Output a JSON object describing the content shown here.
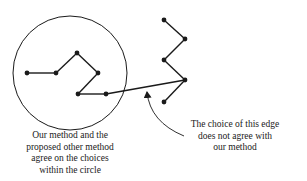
{
  "diagram": {
    "type": "tree-edge-comparison",
    "colors": {
      "stroke": "#1a1a1a",
      "background": "#ffffff"
    },
    "circle": {
      "cx": 70,
      "cy": 73,
      "r": 57
    },
    "nodes": [
      {
        "id": "a",
        "x": 27,
        "y": 73
      },
      {
        "id": "b",
        "x": 56,
        "y": 73
      },
      {
        "id": "c",
        "x": 77,
        "y": 53
      },
      {
        "id": "d",
        "x": 98,
        "y": 73
      },
      {
        "id": "e",
        "x": 78,
        "y": 94
      },
      {
        "id": "f",
        "x": 106,
        "y": 94
      },
      {
        "id": "g",
        "x": 164,
        "y": 20
      },
      {
        "id": "h",
        "x": 185,
        "y": 39
      },
      {
        "id": "i",
        "x": 164,
        "y": 60
      },
      {
        "id": "j",
        "x": 185,
        "y": 80
      },
      {
        "id": "k",
        "x": 164,
        "y": 102
      }
    ],
    "edges": [
      [
        "a",
        "b"
      ],
      [
        "b",
        "c"
      ],
      [
        "c",
        "d"
      ],
      [
        "d",
        "e"
      ],
      [
        "e",
        "f"
      ],
      [
        "f",
        "j"
      ],
      [
        "g",
        "h"
      ],
      [
        "h",
        "i"
      ],
      [
        "i",
        "j"
      ],
      [
        "j",
        "k"
      ]
    ],
    "highlighted_edge": [
      "f",
      "j"
    ],
    "left_caption": {
      "lines": [
        "Our method and the",
        "proposed other method",
        "agree on the choices",
        "within the circle"
      ]
    },
    "right_caption": {
      "lines": [
        "The choice of this edge",
        "does not agree with",
        "our method"
      ]
    }
  }
}
